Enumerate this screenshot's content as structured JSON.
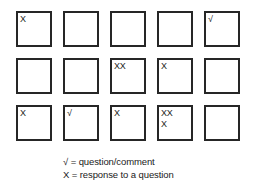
{
  "diagram": {
    "grid": {
      "rows": 3,
      "columns": 5,
      "cells": [
        {
          "id": "r1c1",
          "marks": "X"
        },
        {
          "id": "r1c2",
          "marks": ""
        },
        {
          "id": "r1c3",
          "marks": ""
        },
        {
          "id": "r1c4",
          "marks": ""
        },
        {
          "id": "r1c5",
          "marks": "√"
        },
        {
          "id": "r2c1",
          "marks": ""
        },
        {
          "id": "r2c2",
          "marks": ""
        },
        {
          "id": "r2c3",
          "marks": "XX"
        },
        {
          "id": "r2c4",
          "marks": "X"
        },
        {
          "id": "r2c5",
          "marks": ""
        },
        {
          "id": "r3c1",
          "marks": "X"
        },
        {
          "id": "r3c2",
          "marks": "√"
        },
        {
          "id": "r3c3",
          "marks": "X"
        },
        {
          "id": "r3c4",
          "marks": "XX\nX"
        },
        {
          "id": "r3c5",
          "marks": ""
        }
      ]
    },
    "legend": {
      "line1": "√ = question/comment",
      "line2": "X = response to a question"
    },
    "colors": {
      "border": "#262626",
      "text": "#1a1a1a",
      "background": "#ffffff"
    }
  }
}
